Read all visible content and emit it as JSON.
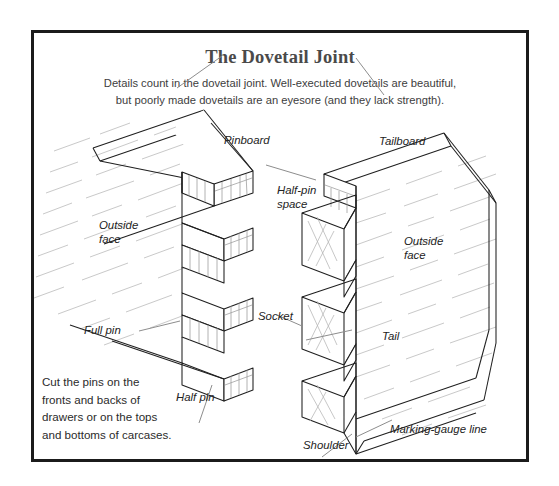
{
  "figure": {
    "title": "The Dovetail Joint",
    "subtitle_line1": "Details count in the dovetail joint. Well-executed dovetails are beautiful,",
    "subtitle_line2": "but poorly made dovetails are an eyesore (and they lack strength).",
    "caption_line1": "Cut the pins on the",
    "caption_line2": "fronts and backs of",
    "caption_line3": "drawers or on the tops",
    "caption_line4": "and bottoms of carcases.",
    "border_color": "#1b1b1b",
    "title_color": "#4a4a4a",
    "line_color": "#1f1f1f",
    "grain_color": "#c9c9c9",
    "leader_color": "#8d8d8d"
  },
  "labels": {
    "pinboard": "Pinboard",
    "tailboard": "Tailboard",
    "outside_face_left": "Outside\nface",
    "outside_face_left_l1": "Outside",
    "outside_face_left_l2": "face",
    "outside_face_right_l1": "Outside",
    "outside_face_right_l2": "face",
    "half_pin_space_l1": "Half-pin",
    "half_pin_space_l2": "space",
    "full_pin": "Full pin",
    "half_pin": "Half pin",
    "socket": "Socket",
    "tail": "Tail",
    "shoulder": "Shoulder",
    "marking_gauge_line": "Marking-gauge line"
  }
}
